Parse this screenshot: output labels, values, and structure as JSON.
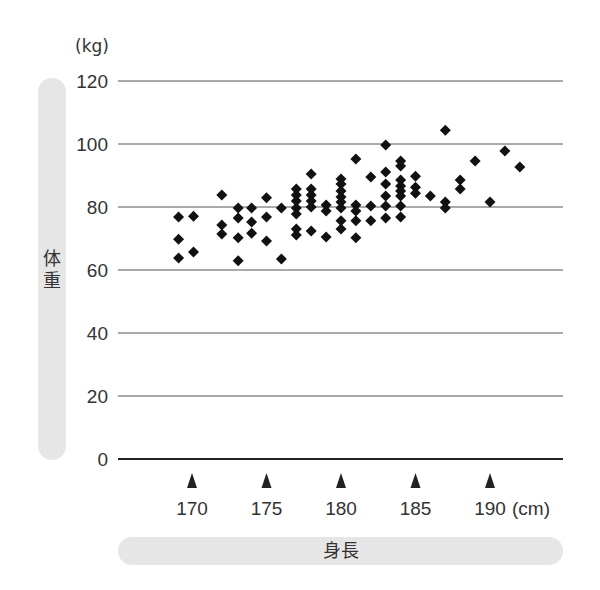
{
  "chart_data": {
    "type": "scatter",
    "title": "",
    "xlabel": "身長",
    "ylabel": "体重",
    "x_unit": "(cm)",
    "y_unit": "(kg)",
    "xlim": [
      164.8,
      194.6
    ],
    "ylim": [
      0,
      120
    ],
    "x_ticks": [
      170,
      175,
      180,
      185,
      190
    ],
    "y_ticks": [
      0,
      20,
      40,
      60,
      80,
      100,
      120
    ],
    "grid": "horizontal",
    "legend": null,
    "marker": "diamond",
    "points": [
      [
        169.1,
        76.8
      ],
      [
        170.1,
        77.1
      ],
      [
        169.1,
        69.8
      ],
      [
        170.1,
        65.7
      ],
      [
        169.1,
        63.8
      ],
      [
        172.0,
        83.8
      ],
      [
        172.0,
        74.3
      ],
      [
        172.0,
        71.4
      ],
      [
        173.1,
        79.7
      ],
      [
        173.1,
        76.5
      ],
      [
        173.1,
        70.2
      ],
      [
        173.1,
        62.9
      ],
      [
        174.0,
        79.7
      ],
      [
        174.0,
        75.2
      ],
      [
        174.0,
        71.7
      ],
      [
        175.0,
        82.9
      ],
      [
        175.0,
        76.8
      ],
      [
        175.0,
        69.2
      ],
      [
        176.0,
        79.7
      ],
      [
        176.0,
        63.5
      ],
      [
        177.0,
        85.7
      ],
      [
        177.0,
        83.8
      ],
      [
        177.0,
        81.9
      ],
      [
        177.0,
        79.7
      ],
      [
        177.0,
        77.8
      ],
      [
        177.0,
        73.0
      ],
      [
        177.0,
        71.1
      ],
      [
        178.0,
        90.5
      ],
      [
        178.0,
        85.7
      ],
      [
        178.0,
        83.8
      ],
      [
        178.0,
        81.9
      ],
      [
        178.0,
        80.0
      ],
      [
        178.0,
        72.4
      ],
      [
        179.0,
        80.6
      ],
      [
        179.0,
        78.7
      ],
      [
        179.0,
        70.5
      ],
      [
        180.0,
        88.9
      ],
      [
        180.0,
        87.3
      ],
      [
        180.0,
        85.1
      ],
      [
        180.0,
        83.2
      ],
      [
        180.0,
        81.6
      ],
      [
        180.0,
        79.7
      ],
      [
        180.0,
        75.6
      ],
      [
        180.0,
        73.0
      ],
      [
        181.0,
        95.2
      ],
      [
        181.0,
        80.6
      ],
      [
        181.0,
        78.7
      ],
      [
        181.0,
        75.6
      ],
      [
        181.0,
        70.2
      ],
      [
        182.0,
        89.5
      ],
      [
        182.0,
        80.3
      ],
      [
        182.0,
        75.6
      ],
      [
        183.0,
        99.7
      ],
      [
        183.0,
        91.1
      ],
      [
        183.0,
        87.3
      ],
      [
        183.0,
        83.5
      ],
      [
        183.0,
        80.3
      ],
      [
        183.0,
        76.5
      ],
      [
        184.0,
        94.6
      ],
      [
        184.0,
        93.0
      ],
      [
        184.0,
        88.6
      ],
      [
        184.0,
        86.7
      ],
      [
        184.0,
        85.1
      ],
      [
        184.0,
        83.5
      ],
      [
        184.0,
        80.3
      ],
      [
        184.0,
        76.8
      ],
      [
        185.0,
        89.8
      ],
      [
        185.0,
        86.3
      ],
      [
        185.0,
        84.4
      ],
      [
        186.0,
        83.5
      ],
      [
        187.0,
        104.4
      ],
      [
        187.0,
        81.6
      ],
      [
        187.0,
        79.7
      ],
      [
        188.0,
        88.6
      ],
      [
        188.0,
        85.7
      ],
      [
        189.0,
        94.6
      ],
      [
        190.0,
        81.6
      ],
      [
        191.0,
        97.8
      ],
      [
        192.0,
        92.7
      ]
    ]
  },
  "labels": {
    "y_unit": "(kg)",
    "x_unit": "(cm)",
    "y_axis_title": "体重",
    "x_axis_title": "身長"
  },
  "colors": {
    "marker": "#111111",
    "grid": "#555555",
    "axis": "#222222",
    "pill": "#e6e6e6",
    "text": "#333333"
  }
}
